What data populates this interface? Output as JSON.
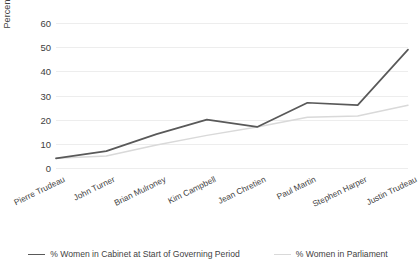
{
  "chart_data": {
    "type": "line",
    "title": "",
    "xlabel": "",
    "ylabel": "Percentage",
    "ylim": [
      0,
      60
    ],
    "yticks": [
      0,
      10,
      20,
      30,
      40,
      50,
      60
    ],
    "grid": true,
    "legend_position": "bottom",
    "categories": [
      "Pierre Trudeau",
      "John Turner",
      "Brian Mulroney",
      "Kim Campbell",
      "Jean Chretien",
      "Paul Martin",
      "Stephen Harper",
      "Justin Trudeau"
    ],
    "series": [
      {
        "name": "% Women in Cabinet at Start of Governing Period",
        "color": "#595959",
        "values": [
          4,
          7,
          14,
          20,
          17,
          27,
          26,
          49
        ]
      },
      {
        "name": "% Women in Parliament",
        "color": "#d9d9d9",
        "values": [
          4,
          5,
          9.5,
          13.5,
          17,
          21,
          21.5,
          26
        ]
      }
    ]
  }
}
